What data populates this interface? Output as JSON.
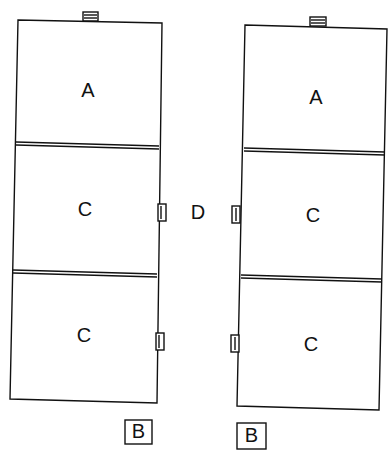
{
  "diagram": {
    "left_stack": {
      "top_module_label": "A",
      "middle_module_label": "C",
      "bottom_module_label": "C",
      "base_label": "B"
    },
    "right_stack": {
      "top_module_label": "A",
      "middle_module_label": "C",
      "bottom_module_label": "C",
      "base_label": "B"
    },
    "connector_label": "D",
    "line_color": "#111111",
    "background_color": "#ffffff"
  }
}
